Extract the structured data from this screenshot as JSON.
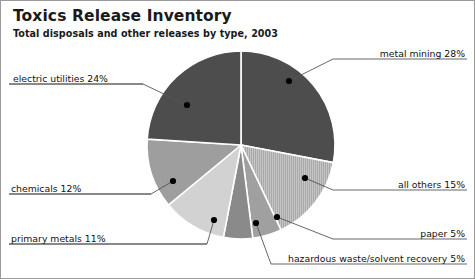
{
  "header": {
    "title": "Toxics Release Inventory",
    "subtitle": "Total disposals and other releases by type, 2003"
  },
  "colors": {
    "panel_border": "#9a9a9a",
    "background": "#ffffff",
    "text": "#111111",
    "leader_line": "#555555",
    "slice_separator": "#ffffff"
  },
  "chart_data": {
    "type": "pie",
    "title": "Toxics Release Inventory",
    "subtitle": "Total disposals and other releases by type, 2003",
    "xlabel": "",
    "ylabel": "",
    "units": "percent",
    "start_angle_deg": 0,
    "direction": "clockwise",
    "center": {
      "x": 240,
      "y": 144
    },
    "radius": 94,
    "legend_position": "callout-labels",
    "grid": false,
    "categories": [
      "metal mining",
      "all others",
      "paper",
      "hazardous waste/solvent recovery",
      "primary metals",
      "chemicals",
      "electric utilities"
    ],
    "values": [
      28,
      15,
      5,
      5,
      11,
      12,
      24
    ],
    "slices": [
      {
        "name": "metal mining",
        "value": 28,
        "label": "metal mining 28%",
        "color": "#4d4d4d",
        "pattern": "solid",
        "label_side": "right",
        "label_x": 364,
        "label_y": 46,
        "underline_x1": 332,
        "underline_x2": 466,
        "underline_y": 58,
        "dot_x": 288,
        "dot_y": 80
      },
      {
        "name": "all others",
        "value": 15,
        "label": "all others 15%",
        "color": "#b4b4b4",
        "pattern": "vertical-hatch",
        "label_side": "right",
        "label_x": 388,
        "label_y": 177,
        "underline_x1": 332,
        "underline_x2": 466,
        "underline_y": 189,
        "dot_x": 304,
        "dot_y": 177
      },
      {
        "name": "paper",
        "value": 5,
        "label": "paper 5%",
        "color": "#a0a0a0",
        "pattern": "solid",
        "label_side": "right",
        "label_x": 416,
        "label_y": 226,
        "underline_x1": 332,
        "underline_x2": 466,
        "underline_y": 238,
        "dot_x": 276,
        "dot_y": 216
      },
      {
        "name": "hazardous waste/solvent recovery",
        "value": 5,
        "label": "hazardous waste/solvent recovery 5%",
        "color": "#8a8a8a",
        "pattern": "solid",
        "label_side": "right",
        "label_x": 279,
        "label_y": 251,
        "underline_x1": 270,
        "underline_x2": 466,
        "underline_y": 263,
        "dot_x": 255,
        "dot_y": 222
      },
      {
        "name": "primary metals",
        "value": 11,
        "label": "primary metals 11%",
        "color": "#d2d2d2",
        "pattern": "solid",
        "label_side": "left",
        "label_x": 10,
        "label_y": 231,
        "underline_x1": 8,
        "underline_x2": 206,
        "underline_y": 243,
        "dot_x": 213,
        "dot_y": 219
      },
      {
        "name": "chemicals",
        "value": 12,
        "label": "chemicals 12%",
        "color": "#9e9e9e",
        "pattern": "solid",
        "label_side": "left",
        "label_x": 10,
        "label_y": 181,
        "underline_x1": 8,
        "underline_x2": 150,
        "underline_y": 193,
        "dot_x": 172,
        "dot_y": 180
      },
      {
        "name": "electric utilities",
        "value": 24,
        "label": "electric utilities 24%",
        "color": "#4d4d4d",
        "pattern": "solid",
        "label_side": "left",
        "label_x": 12,
        "label_y": 71,
        "underline_x1": 8,
        "underline_x2": 142,
        "underline_y": 83,
        "dot_x": 186,
        "dot_y": 104
      }
    ]
  }
}
